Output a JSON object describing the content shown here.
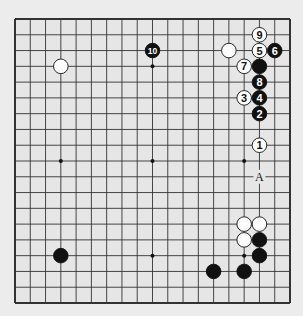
{
  "diagram": {
    "type": "go-board",
    "size": 19,
    "colors": {
      "background": "#ececec",
      "board": "#e6e6e6",
      "line": "#333333",
      "black": "#111111",
      "white": "#ffffff"
    },
    "star_points": [
      [
        3,
        3
      ],
      [
        9,
        3
      ],
      [
        15,
        3
      ],
      [
        3,
        9
      ],
      [
        9,
        9
      ],
      [
        15,
        9
      ],
      [
        3,
        15
      ],
      [
        9,
        15
      ],
      [
        15,
        15
      ]
    ],
    "stones": [
      {
        "color": "white",
        "col": 3,
        "row": 3,
        "label": ""
      },
      {
        "color": "black",
        "col": 9,
        "row": 2,
        "label": "10"
      },
      {
        "color": "white",
        "col": 14,
        "row": 2,
        "label": ""
      },
      {
        "color": "white",
        "col": 16,
        "row": 1,
        "label": "9"
      },
      {
        "color": "white",
        "col": 16,
        "row": 2,
        "label": "5"
      },
      {
        "color": "black",
        "col": 17,
        "row": 2,
        "label": "6"
      },
      {
        "color": "white",
        "col": 15,
        "row": 3,
        "label": "7"
      },
      {
        "color": "black",
        "col": 16,
        "row": 3,
        "label": ""
      },
      {
        "color": "black",
        "col": 16,
        "row": 4,
        "label": "8"
      },
      {
        "color": "white",
        "col": 15,
        "row": 5,
        "label": "3"
      },
      {
        "color": "black",
        "col": 16,
        "row": 5,
        "label": "4"
      },
      {
        "color": "black",
        "col": 16,
        "row": 6,
        "label": "2"
      },
      {
        "color": "white",
        "col": 16,
        "row": 8,
        "label": "1"
      },
      {
        "color": "white",
        "col": 15,
        "row": 13,
        "label": ""
      },
      {
        "color": "white",
        "col": 16,
        "row": 13,
        "label": ""
      },
      {
        "color": "white",
        "col": 15,
        "row": 14,
        "label": ""
      },
      {
        "color": "black",
        "col": 16,
        "row": 14,
        "label": ""
      },
      {
        "color": "black",
        "col": 16,
        "row": 15,
        "label": ""
      },
      {
        "color": "black",
        "col": 3,
        "row": 15,
        "label": ""
      },
      {
        "color": "black",
        "col": 13,
        "row": 16,
        "label": ""
      },
      {
        "color": "black",
        "col": 15,
        "row": 16,
        "label": ""
      }
    ],
    "markers": [
      {
        "col": 16,
        "row": 10,
        "label": "A"
      }
    ]
  }
}
